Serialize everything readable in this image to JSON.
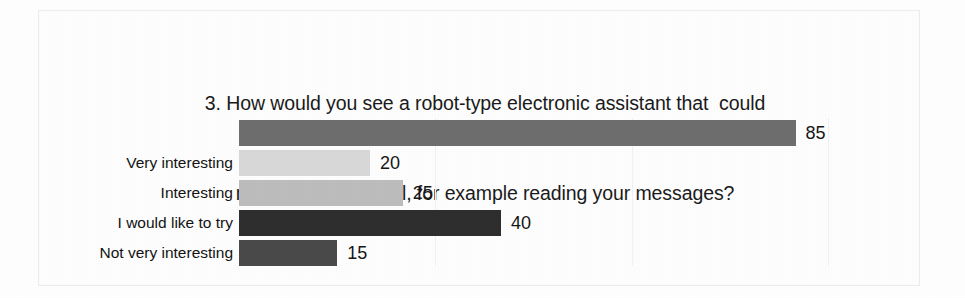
{
  "chart_data": {
    "type": "bar",
    "orientation": "horizontal",
    "title": "3. How would you see a robot-type electronic assistant that  could manage your e-mail, for example reading your messages?",
    "title_lines": [
      "3. How would you see a robot-type electronic assistant that  could",
      "manage your e-mail, for example reading your messages?"
    ],
    "xlabel": "",
    "ylabel": "",
    "xlim": [
      0,
      104
    ],
    "grid": true,
    "grid_axis": "x",
    "legend": false,
    "categories": [
      "",
      "Very interesting",
      "Interesting",
      "I would like to try",
      "Not very interesting"
    ],
    "values": [
      85,
      20,
      25,
      40,
      15
    ],
    "value_labels": [
      "85",
      "20",
      "25",
      "40",
      "15"
    ],
    "bars": [
      {
        "label": "",
        "value": 85,
        "value_label": "85",
        "color": "#6e6e6e"
      },
      {
        "label": "Very interesting",
        "value": 20,
        "value_label": "20",
        "color": "#d9d9d9"
      },
      {
        "label": "Interesting",
        "value": 25,
        "value_label": "25",
        "color": "#bdbdbd"
      },
      {
        "label": "I would like to try",
        "value": 40,
        "value_label": "40",
        "color": "#2e2e2e"
      },
      {
        "label": "Not very interesting",
        "value": 15,
        "value_label": "15",
        "color": "#4a4a4a"
      }
    ],
    "gridline_values": [
      30,
      60,
      90
    ],
    "colors": {
      "background": "#ffffff",
      "frame": "#ededed",
      "text": "#161616",
      "gridline": "#f2f2f2"
    }
  }
}
